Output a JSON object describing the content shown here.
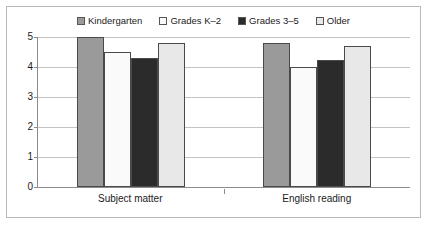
{
  "chart_data": {
    "type": "bar",
    "title": "",
    "subtitle": "",
    "xlabel": "",
    "ylabel": "",
    "categories": [
      "Subject matter",
      "English reading"
    ],
    "series": [
      {
        "name": "Kindergarten",
        "values": [
          5.0,
          4.8
        ],
        "color": "#9a9a9a",
        "swatch": "filled-gray-square"
      },
      {
        "name": "Grades K–2",
        "values": [
          4.5,
          4.0
        ],
        "color": "#fafafa",
        "swatch": "hollow-white-square"
      },
      {
        "name": "Grades 3–5",
        "values": [
          4.3,
          4.25
        ],
        "color": "#2b2b2b",
        "swatch": "filled-black-square"
      },
      {
        "name": "Older",
        "values": [
          4.8,
          4.7
        ],
        "color": "#e8e8e8",
        "swatch": "light-gray-square"
      }
    ],
    "ylim": [
      0,
      5
    ],
    "yticks": [
      0,
      1,
      2,
      3,
      4,
      5
    ],
    "ytick_labels": [
      "0",
      "1",
      "2",
      "3",
      "4",
      "5"
    ],
    "grid": true,
    "grid_axis": "y",
    "legend_position": "top-center",
    "border_color": "#b9b9b9",
    "axis_color": "#8c8c8c",
    "gridline_color": "#c4c4c4",
    "bar_outline_color": "#4a4a4a"
  }
}
